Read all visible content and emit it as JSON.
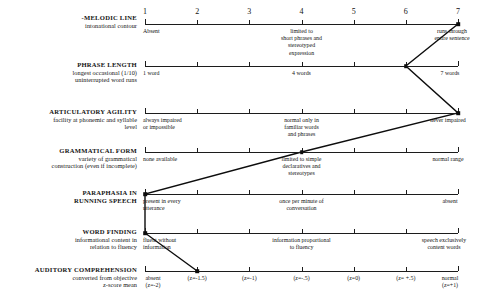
{
  "scale": {
    "numbers": [
      "1",
      "2",
      "3",
      "4",
      "5",
      "6",
      "7"
    ],
    "x_left": 145,
    "x_right": 458,
    "min": 1,
    "max": 7
  },
  "rows": [
    {
      "id": "melodic-line",
      "name_line1": "-MELODIC LINE",
      "name_line2": "intonational contour",
      "y": 24,
      "label_y": 14,
      "show_numbers": true,
      "anchors": [
        {
          "pos": 1,
          "align": "lft",
          "lines": [
            "Absent"
          ],
          "dx": -2,
          "dy": 4
        },
        {
          "pos": 4,
          "align": "ctr",
          "lines": [
            "limited to",
            "short phrases and",
            "stereotyped",
            "expression"
          ],
          "dx": 0,
          "dy": 4
        },
        {
          "pos": 7,
          "align": "ctr",
          "lines": [
            "runs through",
            "entire sentence"
          ],
          "dx": -6,
          "dy": 4
        }
      ],
      "value": 7
    },
    {
      "id": "phrase-length",
      "name_line1": "PHRASE LENGTH",
      "name_line2": "longest occasional (1/10)\nuninterrupted word runs",
      "y": 66,
      "label_y": 61,
      "show_numbers": false,
      "anchors": [
        {
          "pos": 1,
          "align": "lft",
          "lines": [
            "1 word"
          ],
          "dx": -2,
          "dy": 4
        },
        {
          "pos": 4,
          "align": "ctr",
          "lines": [
            "4 words"
          ],
          "dx": 0,
          "dy": 4
        },
        {
          "pos": 7,
          "align": "ctr",
          "lines": [
            "7 words"
          ],
          "dx": -8,
          "dy": 4
        }
      ],
      "value": 6
    },
    {
      "id": "articulatory-agility",
      "name_line1": "ARTICULATORY AGILITY",
      "name_line2": "facility at phonemic and syllable\nlevel",
      "y": 113,
      "label_y": 108,
      "show_numbers": false,
      "anchors": [
        {
          "pos": 1,
          "align": "lft",
          "lines": [
            "always impaired",
            "or impossible"
          ],
          "dx": -2,
          "dy": 4
        },
        {
          "pos": 4,
          "align": "ctr",
          "lines": [
            "normal only in",
            "familiar words",
            "and phrases"
          ],
          "dx": 0,
          "dy": 4
        },
        {
          "pos": 7,
          "align": "ctr",
          "lines": [
            "never impaired"
          ],
          "dx": -10,
          "dy": 4
        }
      ],
      "value": 7
    },
    {
      "id": "grammatical-form",
      "name_line1": "GRAMMATICAL FORM",
      "name_line2": "variety of grammatical\nconstruction (even if incomplete)",
      "y": 152,
      "label_y": 147,
      "show_numbers": false,
      "anchors": [
        {
          "pos": 1,
          "align": "lft",
          "lines": [
            "none available"
          ],
          "dx": -2,
          "dy": 4
        },
        {
          "pos": 4,
          "align": "ctr",
          "lines": [
            "limited to simple",
            "declaratives and",
            "stereotypes"
          ],
          "dx": 0,
          "dy": 4
        },
        {
          "pos": 7,
          "align": "ctr",
          "lines": [
            "normal range"
          ],
          "dx": -10,
          "dy": 4
        }
      ],
      "value": 4
    },
    {
      "id": "paraphasia-in-running-speech",
      "name_line1": "PARAPHASIA IN",
      "name_line2": "RUNNING SPEECH",
      "name2_bold": true,
      "y": 194,
      "label_y": 189,
      "show_numbers": false,
      "anchors": [
        {
          "pos": 1,
          "align": "lft",
          "lines": [
            "present in every",
            "utterance"
          ],
          "dx": -2,
          "dy": 4
        },
        {
          "pos": 4,
          "align": "ctr",
          "lines": [
            "once per minute of",
            "conversation"
          ],
          "dx": 0,
          "dy": 4
        },
        {
          "pos": 7,
          "align": "ctr",
          "lines": [
            "absent"
          ],
          "dx": -8,
          "dy": 4
        }
      ],
      "value": 1
    },
    {
      "id": "word-finding",
      "name_line1": "WORD FINDING",
      "name_line2": "informational content in\nrelation to fluency",
      "y": 233,
      "label_y": 228,
      "show_numbers": false,
      "anchors": [
        {
          "pos": 1,
          "align": "lft",
          "lines": [
            "fluent without",
            "information"
          ],
          "dx": -2,
          "dy": 4
        },
        {
          "pos": 4,
          "align": "ctr",
          "lines": [
            "information proportional",
            "to fluency"
          ],
          "dx": 0,
          "dy": 4
        },
        {
          "pos": 7,
          "align": "ctr",
          "lines": [
            "speech exclusively",
            "content words"
          ],
          "dx": -14,
          "dy": 4
        }
      ],
      "value": 1
    },
    {
      "id": "auditory-comprehension",
      "name_line1": "AUDITORY COMPREHENSION",
      "name_line2": "converted from objective\nz-score mean",
      "y": 271,
      "label_y": 266,
      "show_numbers": false,
      "zscale": [
        "absent\n(z=-2)",
        "(z=-1.5)",
        "(z=-1)",
        "(z=-.5)",
        "(z=0)",
        "(z= +.5)",
        "normal\n(z=+1)"
      ],
      "value": 2
    }
  ],
  "connector": {
    "color": "#0d0d0d",
    "width": 1.4,
    "points": [
      {
        "row": "melodic-line",
        "pos": 7
      },
      {
        "row": "phrase-length",
        "pos": 6
      },
      {
        "row": "articulatory-agility",
        "pos": 7
      },
      {
        "row": "grammatical-form",
        "pos": 4
      },
      {
        "row": "paraphasia-in-running-speech",
        "pos": 1
      },
      {
        "row": "word-finding",
        "pos": 1
      },
      {
        "row": "auditory-comprehension",
        "pos": 2
      }
    ]
  }
}
